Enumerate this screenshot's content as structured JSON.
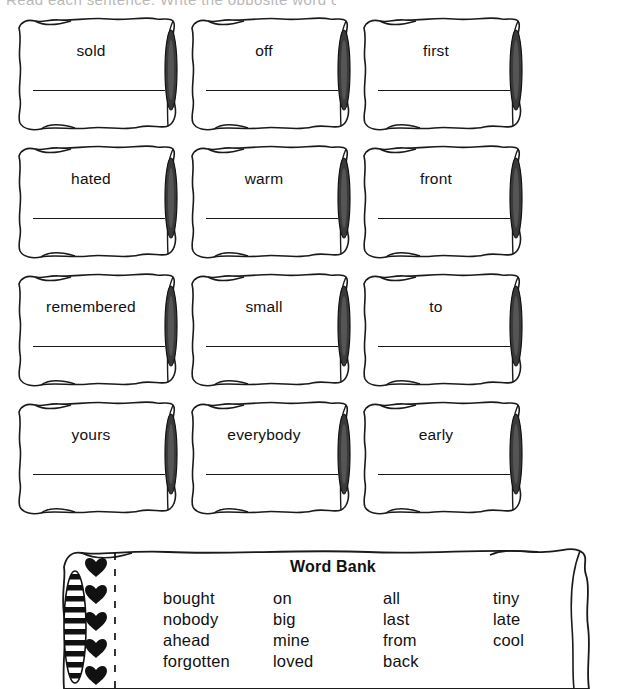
{
  "page": {
    "header_fragment": "Read each sentence. Write the opposite word on the line.",
    "background_color": "#ffffff",
    "ink_color": "#1a1a1a"
  },
  "worksheet": {
    "type": "word-opposites-worksheet",
    "grid": {
      "columns": 3,
      "rows": 4
    },
    "pillows": [
      {
        "word": "sold",
        "row": 1,
        "col": 1
      },
      {
        "word": "off",
        "row": 1,
        "col": 2
      },
      {
        "word": "first",
        "row": 1,
        "col": 3
      },
      {
        "word": "hated",
        "row": 2,
        "col": 1
      },
      {
        "word": "warm",
        "row": 2,
        "col": 2
      },
      {
        "word": "front",
        "row": 2,
        "col": 3
      },
      {
        "word": "remembered",
        "row": 3,
        "col": 1
      },
      {
        "word": "small",
        "row": 3,
        "col": 2
      },
      {
        "word": "to",
        "row": 3,
        "col": 3
      },
      {
        "word": "yours",
        "row": 4,
        "col": 1
      },
      {
        "word": "everybody",
        "row": 4,
        "col": 2
      },
      {
        "word": "early",
        "row": 4,
        "col": 3
      }
    ]
  },
  "word_bank": {
    "title": "Word Bank",
    "hearts_count": 5,
    "columns": [
      {
        "words": [
          "bought",
          "nobody",
          "ahead",
          "forgotten"
        ]
      },
      {
        "words": [
          "on",
          "big",
          "mine",
          "loved"
        ]
      },
      {
        "words": [
          "all",
          "last",
          "from",
          "back"
        ]
      },
      {
        "words": [
          "tiny",
          "late",
          "cool"
        ]
      }
    ]
  },
  "icons": {
    "heart": "heart-icon",
    "pillow_seam": "pillow-seam-icon",
    "striped_seam": "striped-seam-icon",
    "dashed_stitch": "dashed-stitch-icon"
  }
}
